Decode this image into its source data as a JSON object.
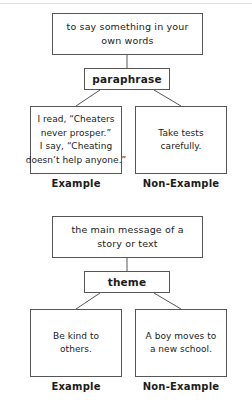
{
  "page": {
    "background_color": "#ffffff",
    "line_color": "#565656",
    "text_color": "#1c1c1c"
  },
  "diagrams": [
    {
      "id": "paraphrase",
      "definition": {
        "line1": "to say something in your",
        "line2": "own words"
      },
      "term": "paraphrase",
      "example": {
        "line1": "I read, “Cheaters",
        "line2": "never prosper.”",
        "line3": "I say, “Cheating",
        "line4": "doesn’t help anyone.”"
      },
      "non_example": {
        "line1": "Take tests",
        "line2": "carefully."
      },
      "example_caption": "Example",
      "non_example_caption": "Non-Example"
    },
    {
      "id": "theme",
      "definition": {
        "line1": "the main message of a",
        "line2": "story or text"
      },
      "term": "theme",
      "example": {
        "line1": "Be kind to",
        "line2": "others."
      },
      "non_example": {
        "line1": "A boy moves to",
        "line2": "a new school."
      },
      "example_caption": "Example",
      "non_example_caption": "Non-Example"
    }
  ]
}
